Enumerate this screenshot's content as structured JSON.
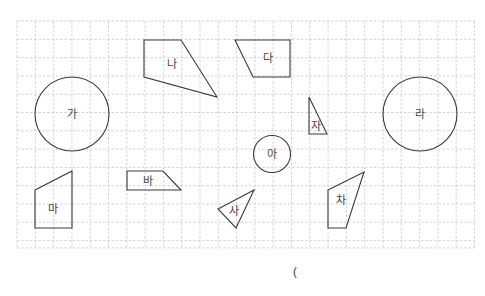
{
  "grid": {
    "x0": 17,
    "y0": 21,
    "step": 18.3,
    "cols": 25,
    "rows": 12.4,
    "line_color": "#c8c8c8"
  },
  "shapes": [
    {
      "id": "ga",
      "label": "가",
      "type": "circle",
      "cx": 72,
      "cy": 114,
      "r": 37
    },
    {
      "id": "na",
      "label": "나",
      "type": "polygon",
      "points": "144,40 181,40 217,97 144,77",
      "lx": 172,
      "ly": 64
    },
    {
      "id": "da",
      "label": "다",
      "type": "polygon",
      "points": "235,40 290,40 290,77 253,77",
      "lx": 268,
      "ly": 58
    },
    {
      "id": "ra",
      "label": "라",
      "type": "circle",
      "cx": 420,
      "cy": 114,
      "r": 37
    },
    {
      "id": "ma",
      "label": "마",
      "type": "polygon",
      "points": "35,190 72,171 72,228 35,228",
      "lx": 53,
      "ly": 209
    },
    {
      "id": "ba",
      "label": "바",
      "type": "polygon",
      "points": "127,171 163,171 181,190 127,190",
      "lx": 148,
      "ly": 181
    },
    {
      "id": "sa",
      "label": "사",
      "type": "polygon",
      "points": "218,209 254,190 236,228",
      "lx": 234,
      "ly": 211
    },
    {
      "id": "a",
      "label": "아",
      "type": "circle",
      "cx": 272,
      "cy": 154,
      "r": 18.5
    },
    {
      "id": "ja",
      "label": "자",
      "type": "polygon",
      "points": "309,97 309,134 327,134",
      "lx": 316,
      "ly": 126
    },
    {
      "id": "cha",
      "label": "차",
      "type": "polygon",
      "points": "328,190 364,172 346,228 328,228",
      "lx": 341,
      "ly": 200
    }
  ],
  "answer_blank": {
    "text": "(",
    "x": 295,
    "y": 272
  },
  "colors": {
    "stroke": "#3a3a3a",
    "label": "#444444"
  }
}
